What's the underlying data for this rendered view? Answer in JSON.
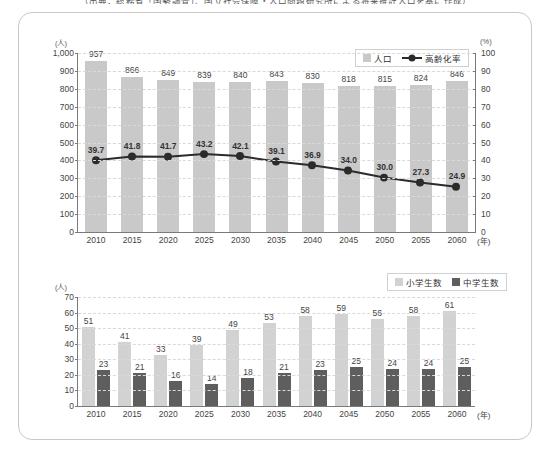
{
  "caption": "（出典：総務省「国勢調査」、国立社会保障・人口問題研究所による将来推計人口を基に作成）",
  "chart_data": [
    {
      "type": "bar",
      "id": "population-aging-chart",
      "title": "",
      "categories": [
        "2010",
        "2015",
        "2020",
        "2025",
        "2030",
        "2035",
        "2040",
        "2045",
        "2050",
        "2055",
        "2060"
      ],
      "xlabel": "(年)",
      "ylabel": "(人)",
      "ylim": [
        0,
        1000
      ],
      "yticks": [
        "0",
        "100",
        "200",
        "300",
        "400",
        "500",
        "600",
        "700",
        "800",
        "900",
        "1,000"
      ],
      "y2label": "(%)",
      "y2lim": [
        0,
        100
      ],
      "y2ticks": [
        "0",
        "10",
        "20",
        "30",
        "40",
        "50",
        "60",
        "70",
        "80",
        "90",
        "100"
      ],
      "grid": true,
      "legend_position": "top-right",
      "series": [
        {
          "name": "人口",
          "kind": "bar",
          "axis": "left",
          "color": "#c9c9c9",
          "values": [
            957,
            866,
            849,
            839,
            840,
            843,
            830,
            818,
            815,
            824,
            846
          ],
          "labels": [
            "957",
            "866",
            "849",
            "839",
            "840",
            "843",
            "830",
            "818",
            "815",
            "824",
            "846"
          ]
        },
        {
          "name": "高齢化率",
          "kind": "line",
          "axis": "right",
          "color": "#2b2b2b",
          "values": [
            39.7,
            41.8,
            41.7,
            43.2,
            42.1,
            39.1,
            36.9,
            34.0,
            30.0,
            27.3,
            24.9
          ],
          "labels": [
            "39.7",
            "41.8",
            "41.7",
            "43.2",
            "42.1",
            "39.1",
            "36.9",
            "34.0",
            "30.0",
            "27.3",
            "24.9"
          ]
        }
      ]
    },
    {
      "type": "bar",
      "id": "students-chart",
      "title": "",
      "categories": [
        "2010",
        "2015",
        "2020",
        "2025",
        "2030",
        "2035",
        "2040",
        "2045",
        "2050",
        "2055",
        "2060"
      ],
      "xlabel": "(年)",
      "ylabel": "(人)",
      "ylim": [
        0,
        70
      ],
      "yticks": [
        "0",
        "10",
        "20",
        "30",
        "40",
        "50",
        "60",
        "70"
      ],
      "grid": true,
      "legend_position": "top-right",
      "series": [
        {
          "name": "小学生数",
          "kind": "bar",
          "color": "#d2d2d2",
          "values": [
            51,
            41,
            33,
            39,
            49,
            53,
            58,
            59,
            56,
            58,
            61
          ],
          "labels": [
            "51",
            "41",
            "33",
            "39",
            "49",
            "53",
            "58",
            "59",
            "56",
            "58",
            "61"
          ]
        },
        {
          "name": "中学生数",
          "kind": "bar",
          "color": "#5e5e5e",
          "values": [
            23,
            21,
            16,
            14,
            18,
            21,
            23,
            25,
            24,
            24,
            25
          ],
          "labels": [
            "23",
            "21",
            "16",
            "14",
            "18",
            "21",
            "23",
            "25",
            "24",
            "24",
            "25"
          ]
        }
      ]
    }
  ]
}
